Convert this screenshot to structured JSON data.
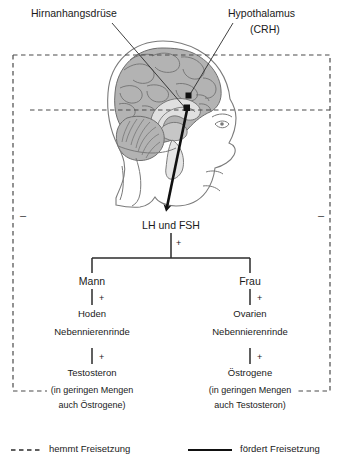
{
  "diagram": {
    "title_labels": {
      "pituitary": "Hirnanhangsdrüse",
      "hypothalamus_line1": "Hypothalamus",
      "hypothalamus_line2": "(CRH)"
    },
    "flow": {
      "gonadotropins": "LH und FSH",
      "plus_sign": "+",
      "minus_sign": "–",
      "male": {
        "sex": "Mann",
        "organs_line1": "Hoden",
        "organs_line2": "Nebennierenrinde",
        "hormone": "Testosteron",
        "note_line1": "(in geringen Mengen",
        "note_line2": "auch Östrogene)"
      },
      "female": {
        "sex": "Frau",
        "organs_line1": "Ovarien",
        "organs_line2": "Nebennierenrinde",
        "hormone": "Östrogene",
        "note_line1": "(in geringen Mengen",
        "note_line2": "auch Testosteron)"
      }
    },
    "legend": {
      "inhibit": "hemmt Freisetzung",
      "promote": "fördert Freisetzung"
    },
    "colors": {
      "ink": "#1a1a1a",
      "line": "#2b2b2b",
      "dashed": "#4a4a4a",
      "brain_gray": "#b3b3b3",
      "brain_gray_dark": "#9a9a9a",
      "brain_gray_light": "#d6d6d6",
      "outline": "#6e6e6e",
      "background": "#ffffff"
    }
  }
}
